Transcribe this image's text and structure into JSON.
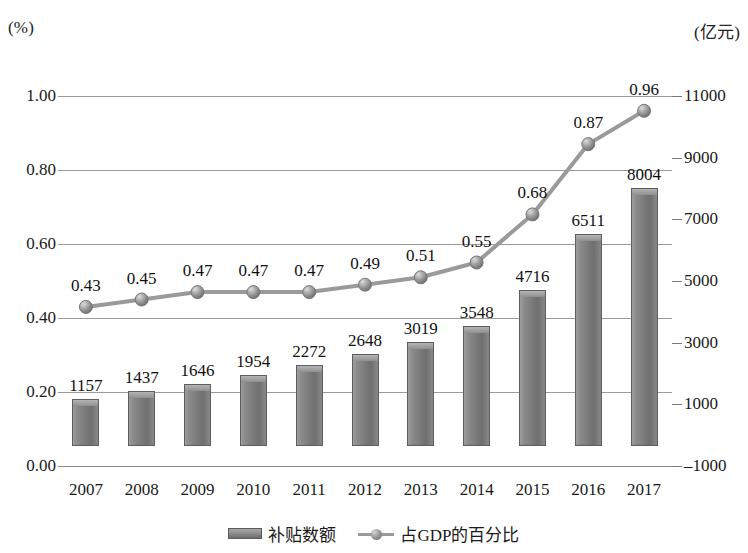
{
  "axes": {
    "left_unit": "(%)",
    "right_unit": "(亿元)",
    "left_ticks": [
      "1.00",
      "0.80",
      "0.60",
      "0.40",
      "0.20",
      "0.00"
    ],
    "right_ticks": [
      "11000",
      "9000",
      "7000",
      "5000",
      "3000",
      "1000",
      "–1000"
    ]
  },
  "legend": {
    "bar_label": "补贴数额",
    "line_label": "占GDP的百分比"
  },
  "chart_data": {
    "type": "bar",
    "title": "",
    "xlabel": "",
    "ylabel": "(%)",
    "y2label": "(亿元)",
    "grid": true,
    "legend_position": "bottom-center",
    "categories": [
      "2007",
      "2008",
      "2009",
      "2010",
      "2011",
      "2012",
      "2013",
      "2014",
      "2015",
      "2016",
      "2017"
    ],
    "ylim": [
      0.0,
      1.0
    ],
    "y2lim": [
      -1000,
      11000
    ],
    "yticks": [
      0.0,
      0.2,
      0.4,
      0.6,
      0.8,
      1.0
    ],
    "y2ticks": [
      -1000,
      1000,
      3000,
      5000,
      7000,
      9000,
      11000
    ],
    "series": [
      {
        "name": "补贴数额",
        "type": "bar",
        "axis": "right",
        "unit": "亿元",
        "values": [
          1157,
          1437,
          1646,
          1954,
          2272,
          2648,
          3019,
          3548,
          4716,
          6511,
          8004
        ],
        "labels": [
          "1157",
          "1437",
          "1646",
          "1954",
          "2272",
          "2648",
          "3019",
          "3548",
          "4716",
          "6511",
          "8004"
        ],
        "color": "#7d7d7d"
      },
      {
        "name": "占GDP的百分比",
        "type": "line",
        "axis": "left",
        "unit": "%",
        "values": [
          0.43,
          0.45,
          0.47,
          0.47,
          0.47,
          0.49,
          0.51,
          0.55,
          0.68,
          0.87,
          0.96
        ],
        "labels": [
          "0.43",
          "0.45",
          "0.47",
          "0.47",
          "0.47",
          "0.49",
          "0.51",
          "0.55",
          "0.68",
          "0.87",
          "0.96"
        ],
        "color": "#9a9a9a"
      }
    ]
  }
}
